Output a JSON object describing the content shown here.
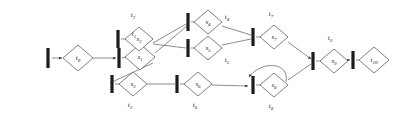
{
  "diagram": {
    "type": "petri-net",
    "width": 399,
    "height": 119,
    "colors": {
      "background": "#ffffff",
      "place_stroke": "#4a4a4a",
      "place_fill": "#ffffff",
      "transition_fill": "#1c1c1c",
      "arc_stroke": "#5a5a5a",
      "label_text": "#1a1a1a"
    },
    "places": [
      {
        "id": "p0",
        "base": "t",
        "sub": "0",
        "label": "t0",
        "cx": 78,
        "cy": 58,
        "rx": 15,
        "ry": 13,
        "inner_base": "t",
        "inner_sub": "0"
      },
      {
        "id": "p1",
        "base": "s",
        "sub": "1",
        "label": "s1",
        "cx": 140,
        "cy": 57,
        "rx": 15,
        "ry": 13,
        "inner_base": "s",
        "inner_sub": "1"
      },
      {
        "id": "p2",
        "base": "s",
        "sub": "2",
        "label": "s2",
        "cx": 139,
        "cy": 39,
        "rx": 14,
        "ry": 12,
        "inner_base": "s",
        "inner_sub": "2"
      },
      {
        "id": "p3",
        "base": "s",
        "sub": "3",
        "label": "s3",
        "cx": 133,
        "cy": 84,
        "rx": 14,
        "ry": 12,
        "inner_base": "s",
        "inner_sub": "3"
      },
      {
        "id": "p4",
        "base": "s",
        "sub": "4",
        "label": "s4",
        "cx": 208,
        "cy": 22,
        "rx": 14,
        "ry": 12,
        "inner_base": "s",
        "inner_sub": "4"
      },
      {
        "id": "p5",
        "base": "s",
        "sub": "5",
        "label": "s5",
        "cx": 208,
        "cy": 48,
        "rx": 14,
        "ry": 12,
        "inner_base": "s",
        "inner_sub": "5"
      },
      {
        "id": "p6",
        "base": "s",
        "sub": "6",
        "label": "s6",
        "cx": 198,
        "cy": 84,
        "rx": 14,
        "ry": 12,
        "inner_base": "s",
        "inner_sub": "6"
      },
      {
        "id": "p7",
        "base": "s",
        "sub": "7",
        "label": "s7",
        "cx": 274,
        "cy": 37,
        "rx": 14,
        "ry": 12,
        "inner_base": "s",
        "inner_sub": "7"
      },
      {
        "id": "p8",
        "base": "s",
        "sub": "8",
        "label": "s8",
        "cx": 274,
        "cy": 85,
        "rx": 14,
        "ry": 12,
        "inner_base": "s",
        "inner_sub": "8"
      },
      {
        "id": "p9",
        "base": "s",
        "sub": "9",
        "label": "s9",
        "cx": 334,
        "cy": 61,
        "rx": 14,
        "ry": 12,
        "inner_base": "s",
        "inner_sub": "9"
      },
      {
        "id": "p10",
        "base": "t",
        "sub": "10",
        "label": "t10",
        "cx": 374,
        "cy": 60,
        "rx": 15,
        "ry": 13,
        "inner_base": "t",
        "inner_sub": "10"
      }
    ],
    "transitions": [
      {
        "id": "b0",
        "x": 48,
        "y": 58,
        "h": 20
      },
      {
        "id": "b1",
        "x": 119,
        "y": 58,
        "h": 20
      },
      {
        "id": "b2",
        "x": 118,
        "y": 39,
        "h": 18
      },
      {
        "id": "b3",
        "x": 112,
        "y": 84,
        "h": 18
      },
      {
        "id": "b4",
        "x": 188,
        "y": 22,
        "h": 18
      },
      {
        "id": "b5",
        "x": 188,
        "y": 48,
        "h": 18
      },
      {
        "id": "b6",
        "x": 177,
        "y": 84,
        "h": 18
      },
      {
        "id": "b7",
        "x": 253,
        "y": 37,
        "h": 18
      },
      {
        "id": "b8",
        "x": 253,
        "y": 85,
        "h": 18
      },
      {
        "id": "b9",
        "x": 313,
        "y": 61,
        "h": 18
      },
      {
        "id": "b10",
        "x": 353,
        "y": 60,
        "h": 18
      }
    ],
    "transition_labels": [
      {
        "id": "lt1",
        "base": "t",
        "sub": "1",
        "label": "t1",
        "x": 134,
        "y": 36
      },
      {
        "id": "lt2",
        "base": "t",
        "sub": "2",
        "label": "t2",
        "x": 133,
        "y": 17
      },
      {
        "id": "lt3",
        "base": "t",
        "sub": "3",
        "label": "t3",
        "x": 130,
        "y": 107
      },
      {
        "id": "lt4",
        "base": "t",
        "sub": "4",
        "label": "t4",
        "x": 227,
        "y": 19
      },
      {
        "id": "lt5",
        "base": "t",
        "sub": "5",
        "label": "t5",
        "x": 227,
        "y": 62
      },
      {
        "id": "lt6",
        "base": "t",
        "sub": "6",
        "label": "t6",
        "x": 195,
        "y": 107
      },
      {
        "id": "lt7",
        "base": "t",
        "sub": "7",
        "label": "t7",
        "x": 271,
        "y": 16
      },
      {
        "id": "lt8",
        "base": "t",
        "sub": "8",
        "label": "t8",
        "x": 271,
        "y": 108
      },
      {
        "id": "lt9",
        "base": "t",
        "sub": "9",
        "label": "t9",
        "x": 330,
        "y": 40
      }
    ],
    "arcs": [
      {
        "id": "a1",
        "from": "b0",
        "to": "p0",
        "d": "M 52,58 L 62,58",
        "arrow": true
      },
      {
        "id": "a2",
        "from": "p0",
        "to": "b1",
        "d": "M 93,58 L 116,58",
        "arrow": true
      },
      {
        "id": "a3",
        "from": "b1",
        "to": "p1",
        "d": "M 122,58 L 126,57",
        "arrow": false
      },
      {
        "id": "a4",
        "from": "p1",
        "to": "b2",
        "d": "M 155,53 L 187,26",
        "arrow": false
      },
      {
        "id": "a5",
        "from": "b2",
        "to": "p2",
        "d": "M 121,39 L 126,39",
        "arrow": false
      },
      {
        "id": "a6",
        "from": "p2",
        "to": "b4",
        "d": "M 153,43 L 186,24",
        "arrow": false
      },
      {
        "id": "a7",
        "from": "p1",
        "to": "b3",
        "d": "M 153,63 L 110,83",
        "arrow": false
      },
      {
        "id": "a8",
        "from": "b3",
        "to": "p3",
        "d": "M 115,84 L 120,84",
        "arrow": false
      },
      {
        "id": "a9",
        "from": "p2",
        "to": "b5",
        "d": "M 153,44 L 186,48",
        "arrow": false
      },
      {
        "id": "a10",
        "from": "b4",
        "to": "p4",
        "d": "M 191,22 L 195,22",
        "arrow": false
      },
      {
        "id": "a11",
        "from": "b5",
        "to": "p5",
        "d": "M 191,48 L 195,48",
        "arrow": false
      },
      {
        "id": "a12",
        "from": "p4",
        "to": "b7",
        "d": "M 222,26 L 251,35",
        "arrow": false
      },
      {
        "id": "a13",
        "from": "p5",
        "to": "b7",
        "d": "M 222,45 L 251,39",
        "arrow": false
      },
      {
        "id": "a14",
        "from": "b7",
        "to": "p7",
        "d": "M 256,37 L 261,37",
        "arrow": false
      },
      {
        "id": "a15",
        "from": "p3",
        "to": "b6",
        "d": "M 147,84 L 175,84",
        "arrow": false
      },
      {
        "id": "a16",
        "from": "b6",
        "to": "p6",
        "d": "M 180,84 L 185,84",
        "arrow": false
      },
      {
        "id": "a17",
        "from": "p6",
        "to": "b8",
        "d": "M 212,85 L 248,86",
        "arrow": true
      },
      {
        "id": "a18",
        "from": "b8",
        "to": "p8",
        "d": "M 256,85 L 261,85",
        "arrow": false
      },
      {
        "id": "a19",
        "from": "p8",
        "to": "b8",
        "d": "M 286,82 C 290,62 262,60 249,77",
        "arrow": true
      },
      {
        "id": "a20",
        "from": "p7",
        "to": "b9",
        "d": "M 288,42 L 311,59",
        "arrow": true
      },
      {
        "id": "a21",
        "from": "p8",
        "to": "b9",
        "d": "M 288,80 L 311,64",
        "arrow": false
      },
      {
        "id": "a22",
        "from": "b9",
        "to": "p9",
        "d": "M 316,61 L 321,61",
        "arrow": false
      },
      {
        "id": "a23",
        "from": "p9",
        "to": "b10",
        "d": "M 348,60 L 350,60",
        "arrow": true
      },
      {
        "id": "a24",
        "from": "b10",
        "to": "p10",
        "d": "M 356,60 L 359,60",
        "arrow": false
      }
    ]
  }
}
